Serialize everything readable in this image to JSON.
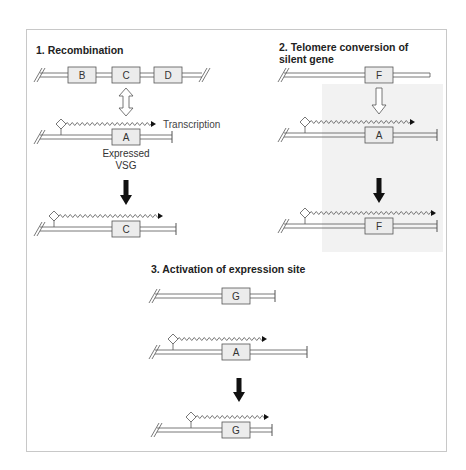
{
  "panels": [
    {
      "title_lines": [
        "1. Recombination"
      ],
      "rows": [
        {
          "genes": [
            "B",
            "C",
            "D"
          ],
          "promoter": false
        },
        {
          "genes": [
            "A"
          ],
          "promoter": true,
          "label": "Transcription",
          "caption": [
            "Expressed",
            "VSG"
          ]
        },
        {
          "genes": [
            "C"
          ],
          "promoter": true
        }
      ]
    },
    {
      "title_lines": [
        "2. Telomere conversion of",
        "silent gene"
      ],
      "rows": [
        {
          "genes": [
            "F"
          ],
          "promoter": false
        },
        {
          "genes": [
            "A"
          ],
          "promoter": true
        },
        {
          "genes": [
            "F"
          ],
          "promoter": true
        }
      ]
    },
    {
      "title_lines": [
        "3. Activation of expression site"
      ],
      "rows": [
        {
          "genes": [
            "G"
          ],
          "promoter": false
        },
        {
          "genes": [
            "A"
          ],
          "promoter": true
        },
        {
          "genes": [
            "G"
          ],
          "promoter": true
        }
      ]
    }
  ],
  "colors": {
    "box_fill": "#ececec",
    "shade": "#f1f1f1",
    "line": "#555555",
    "arrow": "#111111"
  }
}
